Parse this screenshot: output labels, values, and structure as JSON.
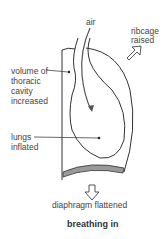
{
  "diagram": {
    "title": "breathing in",
    "labels": {
      "air": "air",
      "ribcage_l1": "ribcage",
      "ribcage_l2": "raised",
      "volume_l1": "volume of",
      "volume_l2": "thoracic",
      "volume_l3": "cavity",
      "volume_l4": "increased",
      "lungs_l1": "lungs",
      "lungs_l2": "inflated",
      "diaphragm": "diaphragm flattened"
    },
    "colors": {
      "stroke": "#333333",
      "diaphragm_fill": "#9a9a9a"
    }
  }
}
